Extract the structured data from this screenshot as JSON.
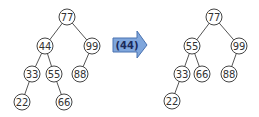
{
  "operation": {
    "label": "(44)",
    "arrow_color": "#7fa6dc",
    "arrow_stroke": "#4a72b0"
  },
  "trees": [
    {
      "name": "before",
      "nodes": [
        {
          "id": "b77",
          "value": "77",
          "x": 67,
          "y": 17
        },
        {
          "id": "b44",
          "value": "44",
          "x": 45,
          "y": 46
        },
        {
          "id": "b99",
          "value": "99",
          "x": 92,
          "y": 46
        },
        {
          "id": "b33",
          "value": "33",
          "x": 32,
          "y": 74
        },
        {
          "id": "b55",
          "value": "55",
          "x": 54,
          "y": 74
        },
        {
          "id": "b88",
          "value": "88",
          "x": 80,
          "y": 74
        },
        {
          "id": "b22",
          "value": "22",
          "x": 22,
          "y": 102
        },
        {
          "id": "b66",
          "value": "66",
          "x": 64,
          "y": 102
        }
      ],
      "edges": [
        [
          "b77",
          "b44"
        ],
        [
          "b77",
          "b99"
        ],
        [
          "b44",
          "b33"
        ],
        [
          "b44",
          "b55"
        ],
        [
          "b99",
          "b88"
        ],
        [
          "b33",
          "b22"
        ],
        [
          "b55",
          "b66"
        ]
      ]
    },
    {
      "name": "after",
      "nodes": [
        {
          "id": "a77",
          "value": "77",
          "x": 214,
          "y": 17
        },
        {
          "id": "a55",
          "value": "55",
          "x": 192,
          "y": 46
        },
        {
          "id": "a99",
          "value": "99",
          "x": 239,
          "y": 46
        },
        {
          "id": "a33",
          "value": "33",
          "x": 182,
          "y": 74
        },
        {
          "id": "a66",
          "value": "66",
          "x": 202,
          "y": 74
        },
        {
          "id": "a88",
          "value": "88",
          "x": 229,
          "y": 74
        },
        {
          "id": "a22",
          "value": "22",
          "x": 172,
          "y": 101
        }
      ],
      "edges": [
        [
          "a77",
          "a55"
        ],
        [
          "a77",
          "a99"
        ],
        [
          "a55",
          "a33"
        ],
        [
          "a55",
          "a66"
        ],
        [
          "a99",
          "a88"
        ],
        [
          "a33",
          "a22"
        ]
      ]
    }
  ]
}
